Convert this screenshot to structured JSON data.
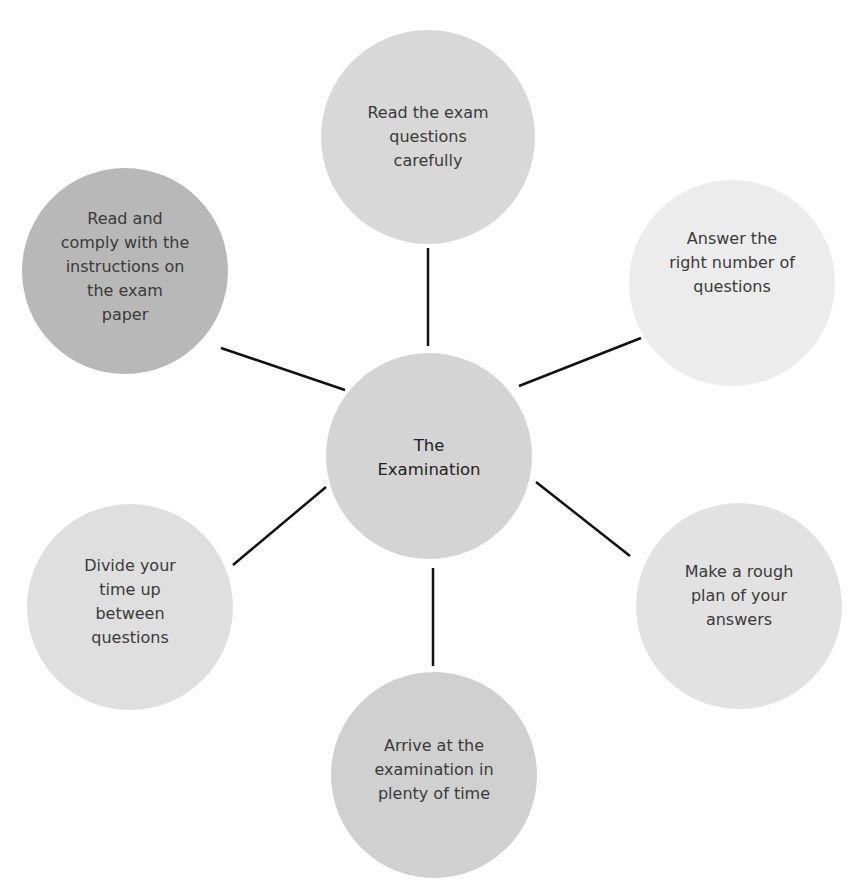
{
  "diagram": {
    "type": "hub-and-spoke",
    "center": {
      "label": "The Examination",
      "lines": [
        "The",
        "Examination"
      ],
      "color": "#d4d4d4"
    },
    "nodes": [
      {
        "id": "top",
        "label": "Read the exam questions carefully",
        "lines": [
          "Read the exam",
          "questions",
          "carefully"
        ],
        "color": "#d8d8d8"
      },
      {
        "id": "top-right",
        "label": "Answer the right number of questions",
        "lines": [
          "Answer the",
          "right number of",
          "questions"
        ],
        "color": "#ececec"
      },
      {
        "id": "bottom-right",
        "label": "Make a rough plan of your answers",
        "lines": [
          "Make a rough",
          "plan of your",
          "answers"
        ],
        "color": "#e2e2e2"
      },
      {
        "id": "bottom",
        "label": "Arrive at the examination in plenty of time",
        "lines": [
          "Arrive at the",
          "examination in",
          "plenty of time"
        ],
        "color": "#d0d0d0"
      },
      {
        "id": "bottom-left",
        "label": "Divide your time up between questions",
        "lines": [
          "Divide your",
          "time up",
          "between",
          "questions"
        ],
        "color": "#dfdfdf"
      },
      {
        "id": "top-left",
        "label": "Read and comply with the instructions on the exam paper",
        "lines": [
          "Read and",
          "comply with the",
          "instructions on",
          "the exam",
          "paper"
        ],
        "color": "#b8b8b8"
      }
    ],
    "connector_color": "#111111"
  }
}
